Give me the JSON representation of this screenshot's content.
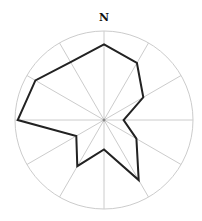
{
  "chart_data": {
    "type": "radar",
    "title": "",
    "direction_label": "N",
    "categories": [
      "0°",
      "30°",
      "60°",
      "90°",
      "120°",
      "150°",
      "180°",
      "210°",
      "240°",
      "270°",
      "300°",
      "330°"
    ],
    "angles_deg": [
      0,
      30,
      60,
      90,
      120,
      150,
      180,
      210,
      240,
      270,
      300,
      330
    ],
    "values": [
      0.85,
      0.74,
      0.51,
      0.22,
      0.42,
      0.78,
      0.33,
      0.6,
      0.36,
      0.97,
      0.89,
      0.75
    ],
    "rlim": [
      0,
      1
    ],
    "grid": true,
    "spokes": 12,
    "legend": null
  },
  "style": {
    "grid_color": "#cccccc",
    "line_color": "#222222",
    "center_dot_color": "#888888"
  }
}
